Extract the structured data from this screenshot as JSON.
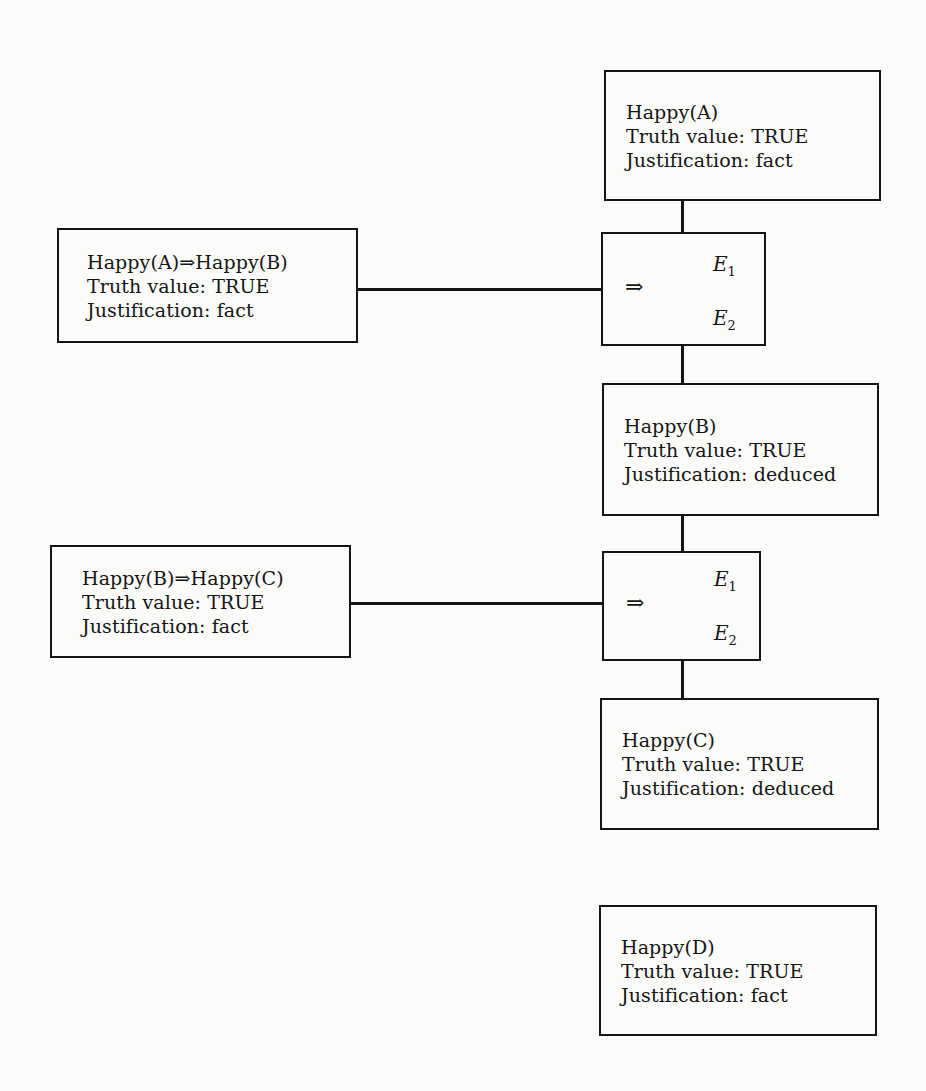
{
  "diagram": {
    "type": "truth-maintenance-network",
    "nodes": [
      {
        "id": "happy-a",
        "lines": [
          "Happy(A)",
          "Truth value: TRUE",
          "Justification: fact"
        ]
      },
      {
        "id": "happy-b",
        "lines": [
          "Happy(B)",
          "Truth value: TRUE",
          "Justification: deduced"
        ]
      },
      {
        "id": "happy-c",
        "lines": [
          "Happy(C)",
          "Truth value: TRUE",
          "Justification: deduced"
        ]
      },
      {
        "id": "happy-d",
        "lines": [
          "Happy(D)",
          "Truth value: TRUE",
          "Justification: fact"
        ]
      },
      {
        "id": "rule-ab",
        "lines": [
          "Happy(A)⇒Happy(B)",
          "Truth value: TRUE",
          "Justification: fact"
        ]
      },
      {
        "id": "rule-bc",
        "lines": [
          "Happy(B)⇒Happy(C)",
          "Truth value: TRUE",
          "Justification: fact"
        ]
      }
    ],
    "rules": [
      {
        "id": "mp-1",
        "symbol": "⇒",
        "e1": "E",
        "e1_sub": "1",
        "e2": "E",
        "e2_sub": "2"
      },
      {
        "id": "mp-2",
        "symbol": "⇒",
        "e1": "E",
        "e1_sub": "1",
        "e2": "E",
        "e2_sub": "2"
      }
    ],
    "edges": [
      [
        "happy-a",
        "mp-1"
      ],
      [
        "rule-ab",
        "mp-1"
      ],
      [
        "mp-1",
        "happy-b"
      ],
      [
        "happy-b",
        "mp-2"
      ],
      [
        "rule-bc",
        "mp-2"
      ],
      [
        "mp-2",
        "happy-c"
      ]
    ]
  }
}
